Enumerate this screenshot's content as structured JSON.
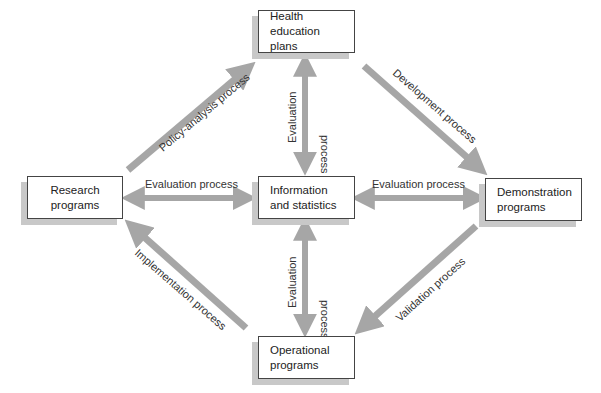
{
  "diagram": {
    "type": "flow-diagram",
    "nodes": {
      "health_education": {
        "line1": "Health education",
        "line2": "plans"
      },
      "research": {
        "line1": "Research",
        "line2": "programs"
      },
      "information": {
        "line1": "Information",
        "line2": "and statistics"
      },
      "demonstration": {
        "line1": "Demonstration",
        "line2": "programs"
      },
      "operational": {
        "line1": "Operational",
        "line2": "programs"
      }
    },
    "edges": {
      "policy_analysis": {
        "label": "Policy-analysis process",
        "from": "Research programs",
        "to": "Health education plans"
      },
      "development": {
        "label": "Development process",
        "from": "Health education plans",
        "to": "Demonstration programs"
      },
      "validation": {
        "label": "Validation process",
        "from": "Demonstration programs",
        "to": "Operational programs"
      },
      "implementation": {
        "label": "Implementation process",
        "from": "Operational programs",
        "to": "Research programs"
      },
      "eval_top": {
        "line1": "Evaluation",
        "line2": "process",
        "bidirectional": true
      },
      "eval_bottom": {
        "line1": "Evaluation",
        "line2": "process",
        "bidirectional": true
      },
      "eval_left": {
        "label": "Evaluation process",
        "bidirectional": true
      },
      "eval_right": {
        "label": "Evaluation process",
        "bidirectional": true
      }
    },
    "colors": {
      "arrow": "#a6a6a6",
      "box_border": "#444444",
      "shadow": "#c8c8c8"
    }
  }
}
